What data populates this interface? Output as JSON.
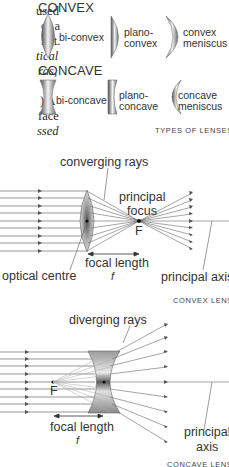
{
  "body_text": {
    "lines": [
      {
        "text": "used",
        "italic": false
      },
      {
        "text": "of a",
        "italic": false
      },
      {
        "text": "n  it.",
        "italic": false
      },
      {
        "text": "tical",
        "italic": true
      },
      {
        "text": "ras,",
        "italic": true
      },
      {
        "text": "",
        "italic": false
      },
      {
        "text": ")   A",
        "italic": false
      },
      {
        "text": "face",
        "italic": false
      },
      {
        "text": "ssed",
        "italic": true
      }
    ]
  },
  "lens_types": {
    "convex_heading": "CONVEX",
    "concave_heading": "CONCAVE",
    "convex": [
      {
        "line1": "bi-convex",
        "line2": ""
      },
      {
        "line1": "plano-",
        "line2": "convex"
      },
      {
        "line1": "convex",
        "line2": "meniscus"
      }
    ],
    "concave": [
      {
        "line1": "bi-concave",
        "line2": ""
      },
      {
        "line1": "plano-",
        "line2": "concave"
      },
      {
        "line1": "concave",
        "line2": "meniscus"
      }
    ],
    "caption": "TYPES OF LENSES"
  },
  "convex_diagram": {
    "rays_label": "converging rays",
    "focus_label_1": "principal",
    "focus_label_2": "focus",
    "focus_letter": "F",
    "centre_label": "optical centre",
    "focal_label": "focal length",
    "focal_symbol": "f",
    "axis_label": "principal axis",
    "caption": "CONVEX LENS"
  },
  "concave_diagram": {
    "rays_label": "diverging rays",
    "focus_letter": "F",
    "focal_label": "focal length",
    "focal_symbol": "f",
    "axis_label_1": "principal",
    "axis_label_2": "axis",
    "caption": "CONCAVE LENS"
  },
  "colors": {
    "ray": "#6a6a6a",
    "lens_dark": "#5a5a5a",
    "lens_light": "#e8e8e8",
    "text": "#333333"
  }
}
